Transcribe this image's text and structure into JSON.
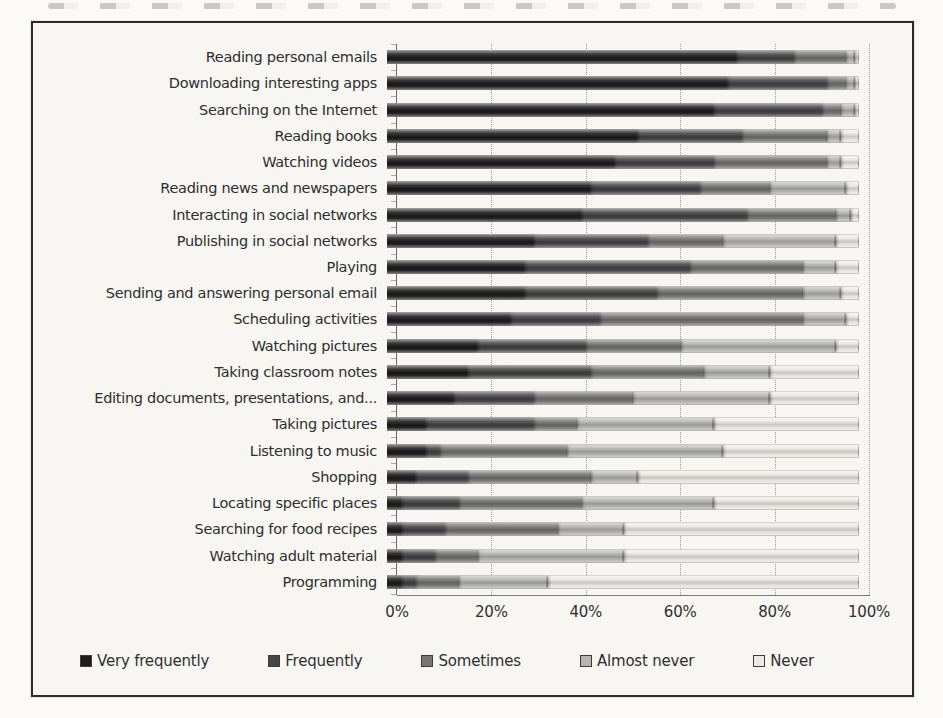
{
  "frame": {
    "background_color": "#f7f6f2",
    "border_color": "#2b2b2b"
  },
  "chart_data": {
    "type": "bar",
    "orientation": "horizontal",
    "stacked": true,
    "unit": "%",
    "title": "",
    "xlabel": "",
    "ylabel": "",
    "grid": "vertical-dotted",
    "categories": [
      "Reading personal emails",
      "Downloading interesting apps",
      "Searching on the Internet",
      "Reading books",
      "Watching videos",
      "Reading news and newspapers",
      "Interacting in social networks",
      "Publishing in social networks",
      "Playing",
      "Sending and answering personal email",
      "Scheduling activities",
      "Watching pictures",
      "Taking classroom notes",
      "Editing documents, presentations, and...",
      "Taking pictures",
      "Listening to music",
      "Shopping",
      "Locating specific places",
      "Searching for food recipes",
      "Watching adult material",
      "Programming"
    ],
    "series": [
      {
        "name": "Very frequently",
        "color": "#1e1e1e",
        "values": [
          74,
          72,
          69,
          53,
          48,
          43,
          41,
          31,
          29,
          29,
          26,
          19,
          17,
          14,
          8,
          8,
          6,
          3,
          3,
          3,
          3
        ]
      },
      {
        "name": "Frequently",
        "color": "#464646",
        "values": [
          12,
          21,
          23,
          22,
          21,
          23,
          35,
          24,
          35,
          28,
          19,
          23,
          26,
          17,
          23,
          3,
          11,
          12,
          9,
          7,
          3
        ]
      },
      {
        "name": "Sometimes",
        "color": "#767674",
        "values": [
          11,
          4,
          4,
          18,
          24,
          15,
          19,
          16,
          24,
          31,
          43,
          20,
          24,
          21,
          9,
          27,
          26,
          26,
          24,
          9,
          9
        ]
      },
      {
        "name": "Almost never",
        "color": "#b6b6b2",
        "values": [
          2,
          2,
          3,
          3,
          3,
          16,
          3,
          24,
          7,
          8,
          9,
          33,
          14,
          29,
          29,
          33,
          10,
          28,
          14,
          31,
          19
        ]
      },
      {
        "name": "Never",
        "color": "#eceae5",
        "values": [
          1,
          1,
          1,
          4,
          4,
          3,
          2,
          5,
          5,
          4,
          3,
          5,
          19,
          19,
          31,
          29,
          47,
          31,
          50,
          50,
          66
        ]
      }
    ],
    "x_axis": {
      "min": 0,
      "max": 100,
      "tick_step": 20,
      "ticks": [
        "0%",
        "20%",
        "40%",
        "60%",
        "80%",
        "100%"
      ]
    },
    "legend": {
      "position": "bottom",
      "items": [
        "Very frequently",
        "Frequently",
        "Sometimes",
        "Almost never",
        "Never"
      ]
    }
  }
}
